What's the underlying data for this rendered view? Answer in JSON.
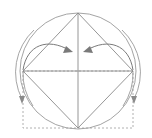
{
  "figure": {
    "title": "",
    "canvas": {
      "width": 152,
      "height": 138,
      "background": "#ffffff"
    },
    "colors": {
      "circle_stroke": "#9a9a9a",
      "square_stroke": "#8a8a8a",
      "diagonal_stroke": "#8a8a8a",
      "arc_stroke": "#9a9a9a",
      "arrow_stroke": "#7a7a7a",
      "dashed_stroke": "#b0b0b0"
    },
    "stroke_widths": {
      "circle": 0.9,
      "square": 0.9,
      "diagonal": 0.9,
      "arc": 0.9,
      "arrow": 1.0,
      "dashed": 1.0
    },
    "circle": {
      "cx": 78,
      "cy": 71,
      "r": 58,
      "label": "circumscribed-circle"
    },
    "center_point": {
      "cx": 78,
      "cy": 71,
      "label": "center"
    },
    "square_vertices": [
      {
        "name": "top",
        "x": 78,
        "y": 13
      },
      {
        "name": "right",
        "x": 133,
        "y": 71
      },
      {
        "name": "bottom",
        "x": 78,
        "y": 128
      },
      {
        "name": "left",
        "x": 23,
        "y": 71
      }
    ],
    "square_path": "M78,13 L133,71 L78,128 L23,71 Z",
    "diagonals": [
      {
        "name": "horizontal-diagonal",
        "x1": 23,
        "y1": 71,
        "x2": 133,
        "y2": 71
      },
      {
        "name": "vertical-diagonal",
        "x1": 78,
        "y1": 13,
        "x2": 78,
        "y2": 128
      }
    ],
    "dashed_rectangle": {
      "name": "bounding-rectangle",
      "x": 23,
      "y": 71,
      "width": 110,
      "height": 57,
      "dash_pattern": "2,2"
    },
    "left_swing_arc": {
      "name": "left-swing-arc",
      "path": "M23,71 A 58 58 0 0 0 32,104",
      "description": "arc from left vertex swinging downward"
    },
    "right_swing_arc": {
      "name": "right-swing-arc",
      "path": "M133,71 A 58 58 0 0 1 124,104",
      "description": "arc from right vertex swinging downward"
    },
    "left_down_arrow": {
      "name": "left-down-arrow",
      "path": "M14,63 A 58 58 0 0 0 22,100",
      "head_points": "22,104 19,96 25,96"
    },
    "right_down_arrow": {
      "name": "right-down-arrow",
      "path": "M142,63 A 58 58 0 0 1 134,100",
      "head_points": "134,104 131,96 137,96"
    },
    "left_rotation_arrow": {
      "name": "left-rotation-arrow",
      "path": "M23,72 C 28,46 50,40 70,51",
      "head_points": "74,53 64,53 67,47"
    },
    "right_rotation_arrow": {
      "name": "right-rotation-arrow",
      "path": "M133,72 C 128,46 106,40 86,51",
      "head_points": "82,53 92,53 89,47"
    },
    "inner_triangle_edges": [
      {
        "name": "top-left-edge",
        "x1": 78,
        "y1": 13,
        "x2": 23,
        "y2": 71
      },
      {
        "name": "top-right-edge",
        "x1": 78,
        "y1": 13,
        "x2": 133,
        "y2": 71
      },
      {
        "name": "bottom-left-edge",
        "x1": 78,
        "y1": 128,
        "x2": 23,
        "y2": 71
      },
      {
        "name": "bottom-right-edge",
        "x1": 78,
        "y1": 128,
        "x2": 133,
        "y2": 71
      }
    ]
  }
}
